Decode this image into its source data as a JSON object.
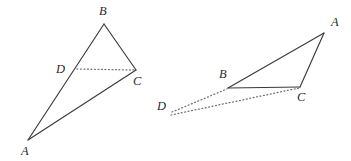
{
  "figure": {
    "background_color": "#ffffff",
    "solid_line_color": "#3a3a3a",
    "dotted_line_color": "#6e6e6e",
    "label_color": "#2a2a2a",
    "figures": [
      {
        "id": "left-figure",
        "description": "Triangle ABC with point D located on side AB and a dotted segment from D to C",
        "points": {
          "A": {
            "x": 28,
            "y": 140
          },
          "B": {
            "x": 104,
            "y": 24
          },
          "C": {
            "x": 136,
            "y": 70
          },
          "D": {
            "x": 76,
            "y": 69
          }
        },
        "labels": [
          {
            "name": "A",
            "text": "A",
            "x": 21,
            "y": 155
          },
          {
            "name": "B",
            "text": "B",
            "x": 99,
            "y": 15
          },
          {
            "name": "C",
            "text": "C",
            "x": 133,
            "y": 85
          },
          {
            "name": "D",
            "text": "D",
            "x": 56,
            "y": 73
          }
        ],
        "solid_paths": [
          {
            "name": "edge-AB",
            "d": "M 28 140 L 104 24"
          },
          {
            "name": "edge-BC",
            "d": "M 104 24 L 136 70"
          },
          {
            "name": "edge-CA",
            "d": "M 136 70 L 28 140"
          }
        ],
        "dotted_paths": [
          {
            "name": "segment-DC",
            "d": "M 77 69 L 134 70"
          }
        ]
      },
      {
        "id": "right-figure",
        "description": "Triangle ABC with external point D joined by dotted segments to B and to C",
        "points": {
          "A": {
            "x": 324,
            "y": 33
          },
          "B": {
            "x": 228,
            "y": 88
          },
          "C": {
            "x": 300,
            "y": 87
          },
          "D": {
            "x": 171,
            "y": 113
          }
        },
        "labels": [
          {
            "name": "A",
            "text": "A",
            "x": 331,
            "y": 26
          },
          {
            "name": "B",
            "text": "B",
            "x": 219,
            "y": 78
          },
          {
            "name": "C",
            "text": "C",
            "x": 297,
            "y": 101
          },
          {
            "name": "D",
            "text": "D",
            "x": 157,
            "y": 110
          }
        ],
        "solid_paths": [
          {
            "name": "edge-BA",
            "d": "M 228 88 L 324 33"
          },
          {
            "name": "edge-AC",
            "d": "M 324 33 L 300 87"
          },
          {
            "name": "edge-CB",
            "d": "M 300 87 L 228 88"
          }
        ],
        "dotted_paths": [
          {
            "name": "segment-DB",
            "d": "M 172 112 L 227 89"
          },
          {
            "name": "segment-DC",
            "d": "M 171 115 L 299 88"
          }
        ]
      }
    ]
  }
}
